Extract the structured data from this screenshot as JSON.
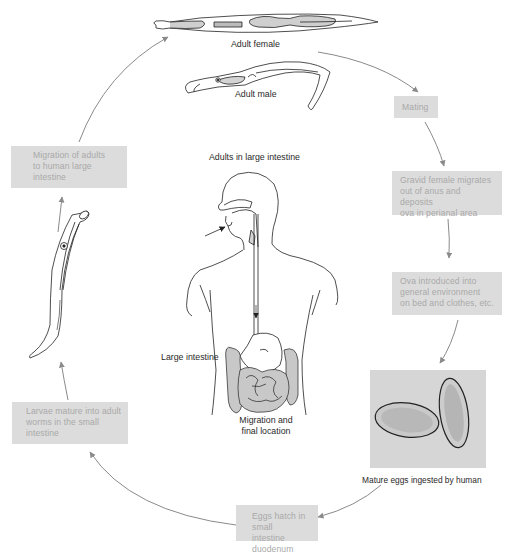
{
  "diagram": {
    "type": "cycle",
    "accent_colors": {
      "box_fill": "#dcdcdc",
      "box_text": "#a9a9a9",
      "arrow": "#8a8a8a",
      "label_text": "#2a2a2a",
      "shading": "#c8c8c8"
    }
  },
  "labels": {
    "adult_female": "Adult female",
    "adult_male": "Adult male",
    "adults_in_large_intestine": "Adults in large intestine",
    "large_intestine": "Large intestine",
    "migration_final_location_line1": "Migration and",
    "migration_final_location_line2": "final location",
    "mature_eggs": "Mature eggs ingested by human"
  },
  "stages": [
    {
      "id": "mating",
      "lines": [
        "Mating"
      ]
    },
    {
      "id": "gravid-female",
      "lines": [
        "Gravid female migrates",
        "out of anus and deposits",
        "ova in perianal area"
      ]
    },
    {
      "id": "ova-introduced",
      "lines": [
        "Ova introduced into",
        "general environment",
        "on bed and clothes, etc."
      ]
    },
    {
      "id": "eggs-hatch",
      "lines": [
        "Eggs hatch in small",
        "intestine duodenum"
      ]
    },
    {
      "id": "larvae-mature",
      "lines": [
        "Larvae mature into adult",
        "worms in the small",
        "intestine"
      ]
    },
    {
      "id": "migration-adults",
      "lines": [
        "Migration of adults",
        "to human large",
        "intestine"
      ]
    }
  ],
  "cycle_order": [
    "adult-female-male",
    "mating",
    "gravid-female",
    "ova-introduced",
    "mature-eggs-photo",
    "eggs-hatch",
    "larvae-mature",
    "larva-worm",
    "migration-adults",
    "adult-female-male"
  ]
}
